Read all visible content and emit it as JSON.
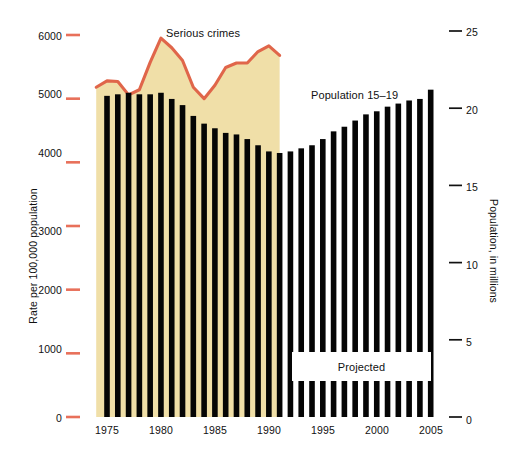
{
  "chart_data": {
    "type": "bar",
    "title": "",
    "subtitle": "",
    "xlabel": "",
    "ylabel": "Rate per 100,000 population",
    "y2label": "Population, in millions",
    "grid": false,
    "legend_position": "inline-annotations",
    "xlim": [
      1973.4,
      2006.2
    ],
    "ylim": [
      0,
      6400
    ],
    "y2lim": [
      0,
      26.7
    ],
    "yticks": [
      0,
      1000,
      2000,
      3000,
      4000,
      5000,
      6000
    ],
    "ytick_labels": [
      "0",
      "1000",
      "2000",
      "3000",
      "4000",
      "5000",
      "6000"
    ],
    "y2ticks": [
      0,
      5,
      10,
      15,
      20,
      25
    ],
    "y2tick_labels": [
      "0",
      "5",
      "10",
      "15",
      "20",
      "25"
    ],
    "xticks": [
      1975,
      1980,
      1985,
      1990,
      1995,
      2000,
      2005
    ],
    "xtick_labels": [
      "1975",
      "1980",
      "1985",
      "1990",
      "1995",
      "2000",
      "2005"
    ],
    "x": [
      1975,
      1976,
      1977,
      1978,
      1979,
      1980,
      1981,
      1982,
      1983,
      1984,
      1985,
      1986,
      1987,
      1988,
      1989,
      1990,
      1991,
      1992,
      1993,
      1994,
      1995,
      1996,
      1997,
      1998,
      1999,
      2000,
      2001,
      2002,
      2003,
      2004,
      2005
    ],
    "series": [
      {
        "name": "Population 15-19",
        "type": "bar",
        "axis": "right",
        "unit": "millions",
        "color": "#050505",
        "values": [
          20.8,
          20.9,
          21.0,
          20.9,
          20.9,
          21.0,
          20.6,
          20.2,
          19.5,
          19.0,
          18.7,
          18.4,
          18.3,
          18.0,
          17.6,
          17.2,
          17.1,
          17.2,
          17.4,
          17.6,
          18.0,
          18.5,
          18.8,
          19.2,
          19.6,
          19.8,
          20.1,
          20.3,
          20.5,
          20.6,
          21.2
        ]
      },
      {
        "name": "Serious crimes",
        "type": "line-area",
        "axis": "left",
        "unit": "rate per 100,000 population",
        "line_color": "#e0664a",
        "fill_color": "#f0dfa8",
        "x": [
          1974,
          1975,
          1976,
          1977,
          1978,
          1979,
          1980,
          1981,
          1982,
          1983,
          1984,
          1985,
          1986,
          1987,
          1988,
          1989,
          1990,
          1991
        ],
        "values": [
          5180,
          5280,
          5270,
          5060,
          5140,
          5570,
          5950,
          5800,
          5600,
          5180,
          5000,
          5210,
          5490,
          5560,
          5560,
          5740,
          5830,
          5680
        ]
      }
    ],
    "annotations": [
      {
        "text": "Serious crimes",
        "x": 1981,
        "y": 6250
      },
      {
        "text": "Population 15–19",
        "x": 1994,
        "y": 21.9
      },
      {
        "text": "Projected",
        "x": 1999,
        "y": 3.4
      }
    ]
  },
  "axes": {
    "left": {
      "title": "Rate per 100,000 population",
      "tick_color": "#e8705a",
      "ticks": [
        {
          "label": "6000",
          "value": 6000
        },
        {
          "label": "5000",
          "value": 5000
        },
        {
          "label": "4000",
          "value": 4000
        },
        {
          "label": "3000",
          "value": 3000
        },
        {
          "label": "2000",
          "value": 2000
        },
        {
          "label": "1000",
          "value": 1000
        },
        {
          "label": "0",
          "value": 0
        }
      ]
    },
    "right": {
      "title": "Population, in millions",
      "tick_color": "#111111",
      "ticks": [
        {
          "label": "25",
          "value": 25
        },
        {
          "label": "20",
          "value": 20
        },
        {
          "label": "15",
          "value": 15
        },
        {
          "label": "10",
          "value": 10
        },
        {
          "label": "5",
          "value": 5
        },
        {
          "label": "0",
          "value": 0
        }
      ]
    },
    "bottom": {
      "ticks": [
        {
          "label": "1975",
          "value": 1975
        },
        {
          "label": "1980",
          "value": 1980
        },
        {
          "label": "1985",
          "value": 1985
        },
        {
          "label": "1990",
          "value": 1990
        },
        {
          "label": "1995",
          "value": 1995
        },
        {
          "label": "2000",
          "value": 2000
        },
        {
          "label": "2005",
          "value": 2005
        }
      ]
    }
  },
  "labels": {
    "serious_crimes": "Serious crimes",
    "population": "Population 15–19",
    "projected": "Projected"
  },
  "colors": {
    "bar": "#050505",
    "crime_line": "#e0664a",
    "crime_fill": "#f0dfa8",
    "left_tick": "#e8705a",
    "right_tick": "#111111",
    "background": "#ffffff",
    "text": "#111111"
  }
}
